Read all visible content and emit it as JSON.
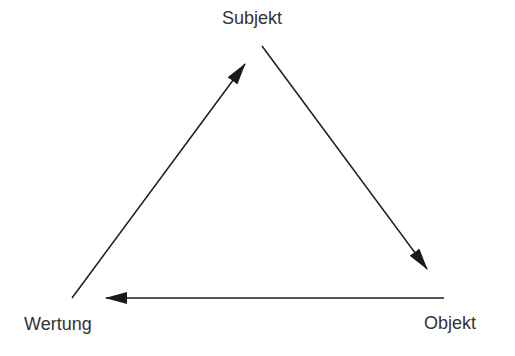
{
  "diagram": {
    "nodes": [
      {
        "id": "subjekt",
        "label": "Subjekt"
      },
      {
        "id": "objekt",
        "label": "Objekt"
      },
      {
        "id": "wertung",
        "label": "Wertung"
      }
    ],
    "edges": [
      {
        "from": "subjekt",
        "to": "objekt"
      },
      {
        "from": "objekt",
        "to": "wertung"
      },
      {
        "from": "wertung",
        "to": "subjekt"
      }
    ],
    "colors": {
      "line": "#1a1a1a",
      "text": "#333333"
    }
  }
}
